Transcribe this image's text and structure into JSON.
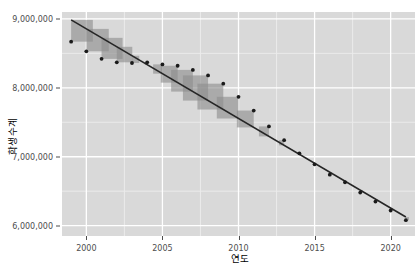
{
  "chart_data": {
    "type": "scatter",
    "title": "",
    "xlabel": "연도",
    "ylabel": "학생수계",
    "xlim": [
      1998.4,
      2021.6
    ],
    "ylim": [
      5850000,
      9100000
    ],
    "grid": true,
    "legend": "none",
    "xticks": [
      2000,
      2005,
      2010,
      2015,
      2020
    ],
    "xtick_labels": [
      "2000",
      "2005",
      "2010",
      "2015",
      "2020"
    ],
    "yticks": [
      6000000,
      7000000,
      8000000,
      9000000
    ],
    "ytick_labels": [
      "6,000,000",
      "7,000,000",
      "8,000,000",
      "9,000,000"
    ],
    "x": [
      1999,
      2000,
      2001,
      2002,
      2003,
      2004,
      2005,
      2006,
      2007,
      2008,
      2009,
      2010,
      2011,
      2012,
      2013,
      2014,
      2015,
      2016,
      2017,
      2018,
      2019,
      2020,
      2021
    ],
    "y": [
      8670000,
      8530000,
      8420000,
      8370000,
      8360000,
      8370000,
      8340000,
      8320000,
      8260000,
      8180000,
      8060000,
      7870000,
      7670000,
      7440000,
      7240000,
      7050000,
      6890000,
      6740000,
      6630000,
      6480000,
      6350000,
      6220000,
      6080000
    ],
    "series": [
      {
        "name": "학생수계 (관측값)",
        "type": "scatter",
        "color": "#1a1a1a",
        "values": [
          8670000,
          8530000,
          8420000,
          8370000,
          8360000,
          8370000,
          8340000,
          8320000,
          8260000,
          8180000,
          8060000,
          7870000,
          7670000,
          7440000,
          7240000,
          7050000,
          6890000,
          6740000,
          6630000,
          6480000,
          6350000,
          6220000,
          6080000
        ]
      },
      {
        "name": "회귀직선 (적합값)",
        "type": "line",
        "color": "#262626",
        "values": [
          8985000,
          8855000,
          8725000,
          8595000,
          8465000,
          8335000,
          8205000,
          8075000,
          7945000,
          7815000,
          7685000,
          7555000,
          7425000,
          7295000,
          7165000,
          7035000,
          6905000,
          6775000,
          6645000,
          6515000,
          6385000,
          6255000,
          6125000
        ]
      }
    ],
    "residuals": [
      -315000,
      -325000,
      -305000,
      -225000,
      -105000,
      35000,
      135000,
      245000,
      315000,
      365000,
      375000,
      315000,
      245000,
      145000,
      75000,
      15000,
      -15000,
      -35000,
      -15000,
      -35000,
      -35000,
      -35000,
      -45000
    ],
    "residual_squares": {
      "fill": "#8c8c8c",
      "opacity": 0.62,
      "note": "squares drawn from each point to the regression line, side length equal to the residual"
    },
    "panel": {
      "background": "#d9d9d9",
      "gridline_major": "#ffffff",
      "gridline_minor": "#ebebeb"
    }
  },
  "axes": {
    "y_title": "학생수계",
    "x_title": "연도"
  }
}
